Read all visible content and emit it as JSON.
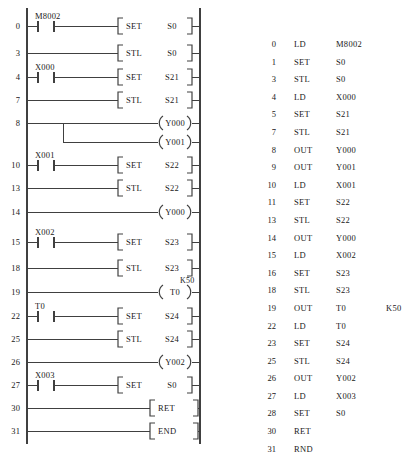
{
  "figure": {
    "type": "plc-ladder-and-instruction-list",
    "line_color": "#404040",
    "text_color": "#202020",
    "background": "#ffffff"
  },
  "ladder": {
    "name": "ladder-diagram",
    "left_rail_x": 27,
    "right_rail_x": 200,
    "rungs": [
      {
        "step": "0",
        "y": 26,
        "contact": "M8002",
        "block_type": "instruction",
        "op": "SET",
        "operand": "S0"
      },
      {
        "step": "3",
        "y": 53,
        "contact": "",
        "block_type": "instruction",
        "op": "STL",
        "operand": "S0"
      },
      {
        "step": "4",
        "y": 77,
        "contact": "X000",
        "block_type": "instruction",
        "op": "SET",
        "operand": "S21"
      },
      {
        "step": "7",
        "y": 100,
        "contact": "",
        "block_type": "instruction",
        "op": "STL",
        "operand": "S21"
      },
      {
        "step": "8",
        "y": 123,
        "contact": "",
        "block_type": "coil",
        "op": "",
        "operand": "Y000",
        "preset": ""
      },
      {
        "step": "",
        "y": 142,
        "contact": "",
        "block_type": "coil-branch",
        "op": "",
        "operand": "Y001",
        "preset": ""
      },
      {
        "step": "10",
        "y": 165,
        "contact": "X001",
        "block_type": "instruction",
        "op": "SET",
        "operand": "S22"
      },
      {
        "step": "13",
        "y": 188,
        "contact": "",
        "block_type": "instruction",
        "op": "STL",
        "operand": "S22"
      },
      {
        "step": "14",
        "y": 212,
        "contact": "",
        "block_type": "coil",
        "op": "",
        "operand": "Y000",
        "preset": ""
      },
      {
        "step": "15",
        "y": 242,
        "contact": "X002",
        "block_type": "instruction",
        "op": "SET",
        "operand": "S23"
      },
      {
        "step": "18",
        "y": 268,
        "contact": "",
        "block_type": "instruction",
        "op": "STL",
        "operand": "S23"
      },
      {
        "step": "19",
        "y": 292,
        "contact": "",
        "block_type": "coil",
        "op": "",
        "operand": "T0",
        "preset": "K50"
      },
      {
        "step": "22",
        "y": 316,
        "contact": "T0",
        "block_type": "instruction",
        "op": "SET",
        "operand": "S24"
      },
      {
        "step": "25",
        "y": 339,
        "contact": "",
        "block_type": "instruction",
        "op": "STL",
        "operand": "S24"
      },
      {
        "step": "26",
        "y": 362,
        "contact": "",
        "block_type": "coil",
        "op": "",
        "operand": "Y002",
        "preset": ""
      },
      {
        "step": "27",
        "y": 385,
        "contact": "X003",
        "block_type": "instruction",
        "op": "SET",
        "operand": "S0"
      },
      {
        "step": "30",
        "y": 408,
        "contact": "",
        "block_type": "instruction-right",
        "op": "RET",
        "operand": ""
      },
      {
        "step": "31",
        "y": 431,
        "contact": "",
        "block_type": "instruction-right",
        "op": "END",
        "operand": ""
      }
    ]
  },
  "instruction_list": {
    "name": "instruction-list",
    "columns": [
      "step",
      "mnemonic",
      "operand",
      "extra"
    ],
    "rows": [
      {
        "step": "0",
        "mnemonic": "LD",
        "operand": "M8002",
        "extra": ""
      },
      {
        "step": "1",
        "mnemonic": "SET",
        "operand": "S0",
        "extra": ""
      },
      {
        "step": "3",
        "mnemonic": "STL",
        "operand": "S0",
        "extra": ""
      },
      {
        "step": "4",
        "mnemonic": "LD",
        "operand": "X000",
        "extra": ""
      },
      {
        "step": "5",
        "mnemonic": "SET",
        "operand": "S21",
        "extra": ""
      },
      {
        "step": "7",
        "mnemonic": "STL",
        "operand": "S21",
        "extra": ""
      },
      {
        "step": "8",
        "mnemonic": "OUT",
        "operand": "Y000",
        "extra": ""
      },
      {
        "step": "9",
        "mnemonic": "OUT",
        "operand": "Y001",
        "extra": ""
      },
      {
        "step": "10",
        "mnemonic": "LD",
        "operand": "X001",
        "extra": ""
      },
      {
        "step": "11",
        "mnemonic": "SET",
        "operand": "S22",
        "extra": ""
      },
      {
        "step": "13",
        "mnemonic": "STL",
        "operand": "S22",
        "extra": ""
      },
      {
        "step": "14",
        "mnemonic": "OUT",
        "operand": "Y000",
        "extra": ""
      },
      {
        "step": "15",
        "mnemonic": "LD",
        "operand": "X002",
        "extra": ""
      },
      {
        "step": "16",
        "mnemonic": "SET",
        "operand": "S23",
        "extra": ""
      },
      {
        "step": "18",
        "mnemonic": "STL",
        "operand": "S23",
        "extra": ""
      },
      {
        "step": "19",
        "mnemonic": "OUT",
        "operand": "T0",
        "extra": "K50"
      },
      {
        "step": "22",
        "mnemonic": "LD",
        "operand": "T0",
        "extra": ""
      },
      {
        "step": "23",
        "mnemonic": "SET",
        "operand": "S24",
        "extra": ""
      },
      {
        "step": "25",
        "mnemonic": "STL",
        "operand": "S24",
        "extra": ""
      },
      {
        "step": "26",
        "mnemonic": "OUT",
        "operand": "Y002",
        "extra": ""
      },
      {
        "step": "27",
        "mnemonic": "LD",
        "operand": "X003",
        "extra": ""
      },
      {
        "step": "28",
        "mnemonic": "SET",
        "operand": "S0",
        "extra": ""
      },
      {
        "step": "30",
        "mnemonic": "RET",
        "operand": "",
        "extra": ""
      },
      {
        "step": "31",
        "mnemonic": "RND",
        "operand": "",
        "extra": ""
      }
    ]
  }
}
